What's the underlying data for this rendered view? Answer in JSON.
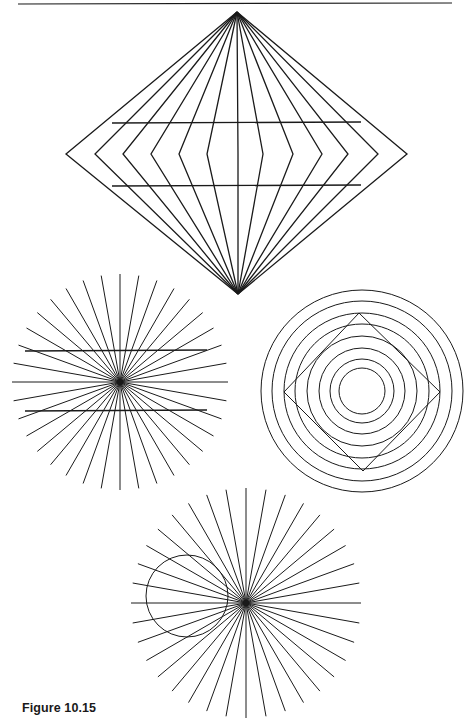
{
  "page": {
    "caption": "Figure 10.15",
    "top_rule": {
      "x1": 18,
      "y1": 4,
      "x2": 452,
      "y2": 3
    }
  },
  "colors": {
    "ink": "#1a1a1a",
    "background": "#ffffff"
  },
  "figures": {
    "diamond": {
      "name": "Wundt-style diamond illusion",
      "apex_top": [
        237,
        12
      ],
      "apex_bottom": [
        238,
        294
      ],
      "vertex_y": 154,
      "vertex_xs": [
        66,
        95,
        123,
        151,
        179,
        207,
        238,
        263,
        293,
        322,
        348,
        378,
        407
      ],
      "parallel_lines": [
        {
          "x1": 112,
          "y1": 123,
          "x2": 361,
          "y2": 122
        },
        {
          "x1": 112,
          "y1": 186,
          "x2": 361,
          "y2": 185
        }
      ]
    },
    "starburst_left": {
      "name": "Hering illusion",
      "center": [
        120,
        382
      ],
      "radius": 108,
      "ray_count": 36,
      "parallel_lines": [
        {
          "x1": 25,
          "y1": 351,
          "x2": 207,
          "y2": 350
        },
        {
          "x1": 25,
          "y1": 411,
          "x2": 207,
          "y2": 410
        }
      ]
    },
    "concentric": {
      "name": "Orbison square illusion",
      "center": [
        362,
        391
      ],
      "radii": [
        101,
        90,
        78,
        67,
        55,
        43,
        32,
        23
      ],
      "square": {
        "top": [
          359,
          313
        ],
        "right": [
          440,
          392
        ],
        "bottom": [
          363,
          471
        ],
        "left": [
          284,
          392
        ]
      }
    },
    "starburst_bottom": {
      "name": "Orbison circle illusion",
      "center": [
        246,
        603
      ],
      "radius": 115,
      "ray_count": 36,
      "circle": {
        "cx": 187,
        "cy": 596,
        "r": 41
      }
    }
  }
}
